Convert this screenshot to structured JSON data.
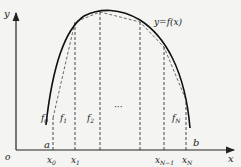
{
  "diagram": {
    "curve_label": "y=f(x)",
    "axes": {
      "x_label": "x",
      "y_label": "y",
      "origin_label": "o"
    },
    "endpoints": {
      "a": "a",
      "b": "b"
    },
    "nodes": [
      {
        "label": "x0",
        "main": "x",
        "sub": "0"
      },
      {
        "label": "x1",
        "main": "x",
        "sub": "1"
      },
      {
        "label": "xN-1",
        "main": "x",
        "sub": "N−1"
      },
      {
        "label": "xN",
        "main": "x",
        "sub": "N"
      }
    ],
    "segments": [
      {
        "main": "f",
        "sub": "0"
      },
      {
        "main": "f",
        "sub": "1"
      },
      {
        "main": "f",
        "sub": "2"
      },
      {
        "main": "f",
        "sub": "N"
      }
    ],
    "ellipsis": "···"
  }
}
